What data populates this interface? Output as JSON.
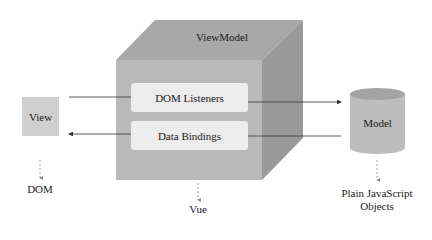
{
  "diagram": {
    "title": "ViewModel",
    "view": {
      "label": "View",
      "below": "DOM"
    },
    "viewmodel": {
      "label": "ViewModel",
      "below": "Vue",
      "inner_boxes": [
        {
          "label": "DOM Listeners",
          "direction": "view-to-model"
        },
        {
          "label": "Data Bindings",
          "direction": "model-to-view"
        }
      ]
    },
    "model": {
      "label": "Model",
      "below_line1": "Plain JavaScript",
      "below_line2": "Objects"
    },
    "colors": {
      "cube_front": "#b9b9b9",
      "cube_top": "#a8a8a8",
      "cube_side": "#9a9a9a",
      "inner_box": "#ececec",
      "view_box": "#cfcfcf",
      "cylinder_body": "#bdbdbd",
      "cylinder_top": "#a3a3a3",
      "line": "#333333",
      "dashed": "#888888"
    }
  }
}
